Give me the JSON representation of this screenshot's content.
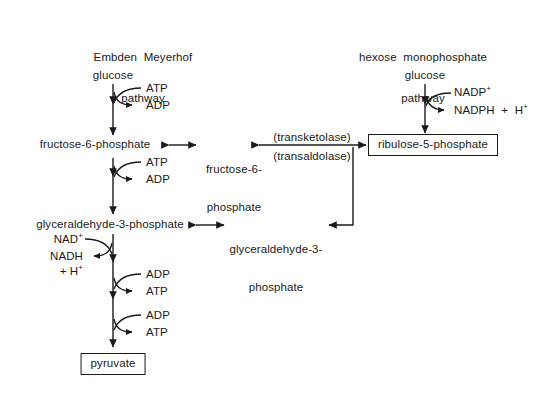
{
  "diagram": {
    "title_emp": "Embden  Meyerhof",
    "title_emp2": "pathway",
    "title_hmp": "hexose  monophosphate",
    "title_hmp2": "pathway",
    "line_color": "#1a1a1a",
    "background": "#ffffff"
  },
  "emp": {
    "glucose": "glucose",
    "atp1": "ATP",
    "adp1": "ADP",
    "fructose6p": "fructose-6-phosphate",
    "atp2": "ATP",
    "adp2": "ADP",
    "gap": "glyceraldehyde-3-phosphate",
    "nad": "NAD",
    "nad_sup": "+",
    "nadh": "NADH",
    "nadh_h": "+ H",
    "nadh_h_sup": "+",
    "adp3": "ADP",
    "atp3": "ATP",
    "adp4": "ADP",
    "atp4": "ATP",
    "pyruvate": "pyruvate"
  },
  "hmp": {
    "glucose": "glucose",
    "nadp": "NADP",
    "nadp_sup": "+",
    "nadph": "NADPH  +  H",
    "nadph_sup": "+",
    "ribulose5p": "ribulose-5-phosphate"
  },
  "bridge": {
    "fructose6p_l1": "fructose-6-",
    "fructose6p_l2": "phosphate",
    "gap_l1": "glyceraldehyde-3-",
    "gap_l2": "phosphate",
    "transketolase": "(transketolase)",
    "transaldolase": "(transaldolase)"
  }
}
